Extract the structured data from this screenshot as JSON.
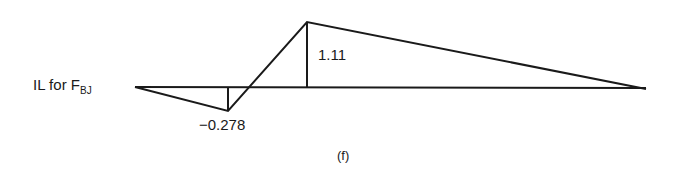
{
  "diagram": {
    "title_main": "IL for F",
    "title_sub": "BJ",
    "caption": "(f)",
    "line_color": "#1a1a1a",
    "points": {
      "start": {
        "x": 135,
        "y": 87,
        "value": 0
      },
      "min": {
        "x": 228,
        "y": 111,
        "value": -0.278
      },
      "zero": {
        "x": 252,
        "y": 87,
        "value": 0
      },
      "max": {
        "x": 307,
        "y": 22,
        "value": 1.11
      },
      "end": {
        "x": 646,
        "y": 89,
        "value": 0
      }
    },
    "labels": {
      "min_value": "−0.278",
      "max_value": "1.11"
    }
  }
}
